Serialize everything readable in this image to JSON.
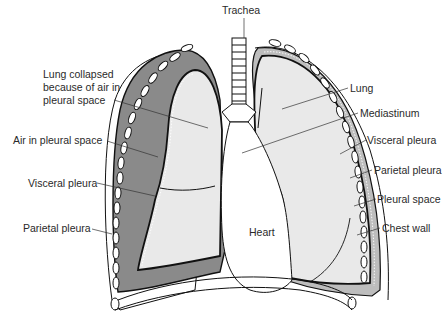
{
  "figure": {
    "colors": {
      "air_space": "#8a8a8a",
      "lung_fill": "#e9e9e9",
      "outline": "#111111",
      "background": "#ffffff",
      "text": "#2a2a2a"
    }
  },
  "labels": {
    "trachea": "Trachea",
    "lung_collapsed": "Lung collapsed because of air in pleural space",
    "air_in_pleural_space": "Air in pleural space",
    "visceral_pleura_left": "Visceral pleura",
    "parietal_pleura_left": "Parietal pleura",
    "lung": "Lung",
    "mediastinum": "Mediastinum",
    "visceral_pleura_right": "Visceral pleura",
    "parietal_pleura_right": "Parietal pleura",
    "pleural_space": "Pleural space",
    "chest_wall": "Chest wall",
    "heart": "Heart"
  }
}
